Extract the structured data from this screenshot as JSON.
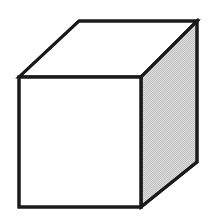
{
  "figure": {
    "background_color": "#ffffff",
    "canvas": {
      "width": 217,
      "height": 219
    },
    "stroke": {
      "color": "#1a1a1a",
      "width": 3,
      "join": "miter"
    },
    "faces": [
      {
        "id": "top-face",
        "label": "Top face",
        "fill": "#ffffff",
        "shaded": false,
        "points": "19,77 79,21 197,21 141,77"
      },
      {
        "id": "front-face",
        "label": "Front face",
        "fill": "#ffffff",
        "shaded": false,
        "points": "19,77 141,77 141,207 19,207"
      },
      {
        "id": "right-face",
        "label": "Right side face",
        "fill": "#d3d3d3",
        "shaded": true,
        "points": "141,77 197,21 197,162 141,207"
      }
    ],
    "vertices": [
      {
        "id": "front-top-left",
        "x": 19,
        "y": 77
      },
      {
        "id": "front-top-right",
        "x": 141,
        "y": 77
      },
      {
        "id": "front-bottom-right",
        "x": 141,
        "y": 207
      },
      {
        "id": "front-bottom-left",
        "x": 19,
        "y": 207
      },
      {
        "id": "back-top-left",
        "x": 79,
        "y": 21
      },
      {
        "id": "back-top-right",
        "x": 197,
        "y": 21
      },
      {
        "id": "back-bottom-right",
        "x": 197,
        "y": 162
      }
    ],
    "edges": [
      {
        "id": "edge-front-top",
        "from": "front-top-left",
        "to": "front-top-right"
      },
      {
        "id": "edge-front-right",
        "from": "front-top-right",
        "to": "front-bottom-right"
      },
      {
        "id": "edge-front-bottom",
        "from": "front-bottom-right",
        "to": "front-bottom-left"
      },
      {
        "id": "edge-front-left",
        "from": "front-bottom-left",
        "to": "front-top-left"
      },
      {
        "id": "edge-top-left-diagonal",
        "from": "front-top-left",
        "to": "back-top-left"
      },
      {
        "id": "edge-top-back",
        "from": "back-top-left",
        "to": "back-top-right"
      },
      {
        "id": "edge-top-right-diagonal",
        "from": "back-top-right",
        "to": "front-top-right"
      },
      {
        "id": "edge-right-back-vertical",
        "from": "back-top-right",
        "to": "back-bottom-right"
      },
      {
        "id": "edge-right-bottom-diagonal",
        "from": "back-bottom-right",
        "to": "front-bottom-right"
      }
    ]
  }
}
